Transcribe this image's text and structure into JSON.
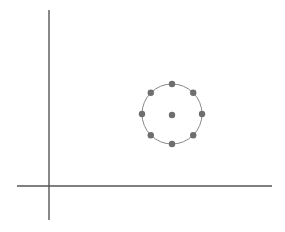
{
  "diagram": {
    "axes": {
      "x_axis": {
        "x1": 17,
        "y1": 186,
        "x2": 272,
        "y2": 186,
        "color": "#555555"
      },
      "y_axis": {
        "x1": 49,
        "y1": 10,
        "x2": 49,
        "y2": 220,
        "color": "#555555"
      }
    },
    "circle": {
      "cx": 172,
      "cy": 114,
      "r": 30,
      "stroke": "#888888"
    },
    "center_point": {
      "cx": 172,
      "cy": 115,
      "r": 3.2,
      "fill": "#6e6e6e"
    },
    "ring_points": [
      {
        "angle_deg": 90
      },
      {
        "angle_deg": 45
      },
      {
        "angle_deg": 0
      },
      {
        "angle_deg": -45
      },
      {
        "angle_deg": -90
      },
      {
        "angle_deg": -135
      },
      {
        "angle_deg": 180
      },
      {
        "angle_deg": 135
      }
    ],
    "point_radius": 3.2,
    "point_color": "#6e6e6e"
  }
}
